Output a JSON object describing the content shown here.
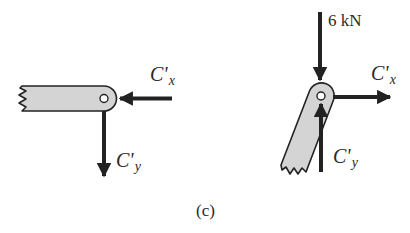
{
  "figure": {
    "caption": "(c)",
    "colors": {
      "member_fill": "#d4d4d4",
      "stroke": "#222222",
      "background": "#ffffff"
    }
  },
  "left_fbd": {
    "member": "horizontal member with pin at right end, broken (zigzag) left end",
    "forces": [
      {
        "id": "Cx_left",
        "symbol": "C'",
        "subscript": "x",
        "direction": "left",
        "label": "C'x"
      },
      {
        "id": "Cy_left",
        "symbol": "C'",
        "subscript": "y",
        "direction": "down",
        "label": "C'y"
      }
    ]
  },
  "right_fbd": {
    "member": "inclined member with pin at top end, broken (zigzag) bottom end",
    "forces": [
      {
        "id": "load",
        "label": "6 kN",
        "direction": "down"
      },
      {
        "id": "Cx_right",
        "symbol": "C'",
        "subscript": "x",
        "direction": "right",
        "label": "C'x"
      },
      {
        "id": "Cy_right",
        "symbol": "C'",
        "subscript": "y",
        "direction": "up",
        "label": "C'y"
      }
    ]
  }
}
